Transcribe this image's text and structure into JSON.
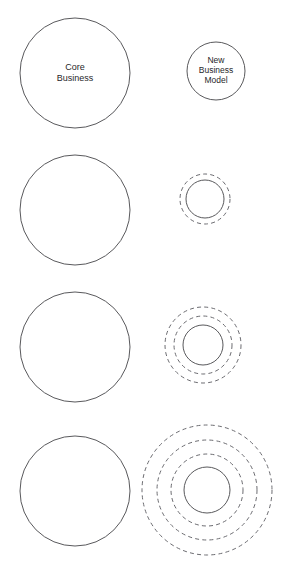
{
  "diagram": {
    "type": "concentric-circles-progression",
    "canvas": {
      "width": 285,
      "height": 572
    },
    "stroke_color_solid": "#59595c",
    "stroke_color_dashed": "#6b6b70",
    "background_color": "#ffffff",
    "labels": {
      "core_business_line1": "Core",
      "core_business_line2": "Business",
      "new_business_line1": "New",
      "new_business_line2": "Business",
      "new_business_line3": "Model"
    },
    "rows": [
      {
        "index": 1,
        "left": {
          "name": "core-business-circle",
          "cx": 75,
          "cy": 73,
          "r": 55,
          "style": "solid",
          "labeled": true
        },
        "right": {
          "name": "new-business-model-circle",
          "cx": 216,
          "cy": 71,
          "r": 29,
          "style": "solid",
          "labeled": true,
          "dashed_rings": []
        }
      },
      {
        "index": 2,
        "left": {
          "name": "core-business-circle",
          "cx": 75,
          "cy": 210,
          "r": 55,
          "style": "solid",
          "labeled": false
        },
        "right": {
          "name": "new-business-model-circle",
          "cx": 205,
          "cy": 199,
          "r": 19,
          "style": "solid",
          "labeled": false,
          "dashed_rings": [
            25
          ]
        }
      },
      {
        "index": 3,
        "left": {
          "name": "core-business-circle",
          "cx": 75,
          "cy": 347,
          "r": 55,
          "style": "solid",
          "labeled": false
        },
        "right": {
          "name": "new-business-model-circle",
          "cx": 203,
          "cy": 345,
          "r": 20,
          "style": "solid",
          "labeled": false,
          "dashed_rings": [
            29,
            38
          ]
        }
      },
      {
        "index": 4,
        "left": {
          "name": "core-business-circle",
          "cx": 75,
          "cy": 491,
          "r": 55,
          "style": "solid",
          "labeled": false
        },
        "right": {
          "name": "new-business-model-circle",
          "cx": 207,
          "cy": 490,
          "r": 23,
          "style": "solid",
          "labeled": false,
          "dashed_rings": [
            36,
            50,
            65
          ]
        }
      }
    ]
  }
}
